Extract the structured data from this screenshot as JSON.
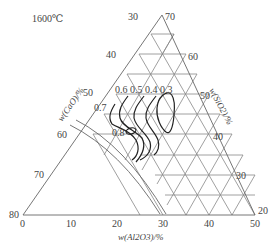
{
  "diagram": {
    "temperature_label": "1600℃",
    "axes": {
      "left": {
        "title": "w(CaO)/%",
        "ticks": [
          "30",
          "40",
          "50",
          "60",
          "70",
          "80"
        ]
      },
      "right": {
        "title": "w(SiO2)/%",
        "ticks": [
          "70",
          "60",
          "50",
          "40",
          "30",
          "20"
        ]
      },
      "bottom": {
        "title": "w(Al2O3)/%",
        "ticks": [
          "0",
          "10",
          "20",
          "30",
          "40",
          "50"
        ]
      }
    },
    "contours": [
      {
        "label": "0.6"
      },
      {
        "label": "0.5"
      },
      {
        "label": "0.4"
      },
      {
        "label": "0.3"
      },
      {
        "label": "0.7"
      },
      {
        "label": "0.8"
      }
    ],
    "colors": {
      "grid": "#777777",
      "contour": "#222222",
      "text": "#444444"
    }
  }
}
